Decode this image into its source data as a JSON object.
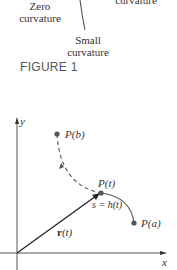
{
  "figure1": {
    "labels": {
      "zero_curvature": "Zero\ncurvature",
      "zero_line1": "Zero",
      "zero_line2": "curvature",
      "top_right": "curvature",
      "small_line1": "Small",
      "small_line2": "curvature"
    },
    "caption": "FIGURE 1"
  },
  "figure2": {
    "axes": {
      "x_label": "x",
      "y_label": "y"
    },
    "points": {
      "pb": "P(b)",
      "pt": "P(t)",
      "pa": "P(a)"
    },
    "arc_label": "s = h(t)",
    "vector_label_bold": "r",
    "vector_label_rest": "(t)"
  }
}
